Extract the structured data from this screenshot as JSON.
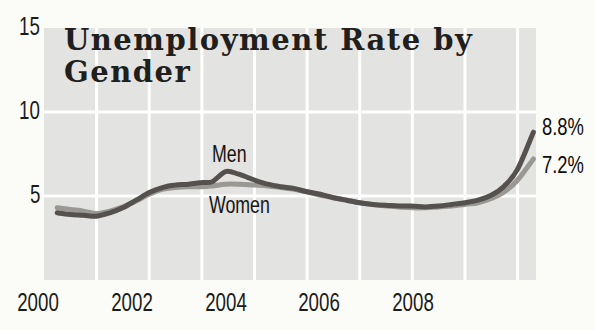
{
  "chart_data": {
    "type": "line",
    "title": "Unemployment Rate by Gender",
    "title_lines": [
      "Unemployment Rate by",
      "Gender"
    ],
    "xlabel": "",
    "ylabel": "",
    "xlim": [
      2000,
      2009.35
    ],
    "ylim": [
      0,
      15
    ],
    "x_tick_labels": [
      "2000",
      "2002",
      "2004",
      "2006",
      "2008"
    ],
    "x_tick_years": [
      2000,
      2002,
      2004,
      2006,
      2008
    ],
    "y_tick_labels": [
      "15",
      "10",
      "5"
    ],
    "y_tick_values": [
      15,
      10,
      5
    ],
    "grid": {
      "enabled": true,
      "vertical_years": [
        2001,
        2002,
        2003,
        2004,
        2005,
        2006,
        2007,
        2008,
        2009
      ],
      "horizontal_values": [
        5,
        10
      ]
    },
    "legend_position": "inline-labels",
    "colors": {
      "plot_bg": "#e3e3e1",
      "grid": "#ffffff",
      "page_bg": "#fbfbf8",
      "title_text": "#211f1d",
      "axis_text": "#1c1b19",
      "end_label_text": "#0c0b0a"
    },
    "series": [
      {
        "name": "Women",
        "color": "#9a9894",
        "end_label": "7.2%",
        "end_value": 7.2,
        "points": [
          [
            2000.25,
            4.3
          ],
          [
            2000.5,
            4.2
          ],
          [
            2000.75,
            4.1
          ],
          [
            2001,
            3.95
          ],
          [
            2001.25,
            4.1
          ],
          [
            2001.5,
            4.35
          ],
          [
            2001.75,
            4.7
          ],
          [
            2002,
            5.1
          ],
          [
            2002.25,
            5.4
          ],
          [
            2002.5,
            5.5
          ],
          [
            2002.75,
            5.55
          ],
          [
            2003,
            5.55
          ],
          [
            2003.2,
            5.6
          ],
          [
            2003.45,
            5.7
          ],
          [
            2003.7,
            5.7
          ],
          [
            2004,
            5.65
          ],
          [
            2004.25,
            5.6
          ],
          [
            2004.5,
            5.5
          ],
          [
            2004.75,
            5.4
          ],
          [
            2005,
            5.25
          ],
          [
            2005.25,
            5.05
          ],
          [
            2005.5,
            4.9
          ],
          [
            2005.75,
            4.75
          ],
          [
            2006,
            4.6
          ],
          [
            2006.25,
            4.5
          ],
          [
            2006.5,
            4.4
          ],
          [
            2006.75,
            4.35
          ],
          [
            2007,
            4.3
          ],
          [
            2007.25,
            4.3
          ],
          [
            2007.5,
            4.35
          ],
          [
            2007.75,
            4.4
          ],
          [
            2008,
            4.5
          ],
          [
            2008.25,
            4.6
          ],
          [
            2008.5,
            4.85
          ],
          [
            2008.75,
            5.25
          ],
          [
            2009,
            5.95
          ],
          [
            2009.3,
            7.2
          ]
        ]
      },
      {
        "name": "Men",
        "color": "#54514e",
        "end_label": "8.8%",
        "end_value": 8.8,
        "points": [
          [
            2000.25,
            4.0
          ],
          [
            2000.5,
            3.9
          ],
          [
            2000.75,
            3.85
          ],
          [
            2001,
            3.8
          ],
          [
            2001.25,
            4.0
          ],
          [
            2001.5,
            4.3
          ],
          [
            2001.75,
            4.75
          ],
          [
            2002,
            5.2
          ],
          [
            2002.25,
            5.5
          ],
          [
            2002.5,
            5.65
          ],
          [
            2002.75,
            5.7
          ],
          [
            2003,
            5.8
          ],
          [
            2003.2,
            5.85
          ],
          [
            2003.45,
            6.45
          ],
          [
            2003.7,
            6.3
          ],
          [
            2004,
            5.95
          ],
          [
            2004.25,
            5.7
          ],
          [
            2004.5,
            5.55
          ],
          [
            2004.75,
            5.45
          ],
          [
            2005,
            5.25
          ],
          [
            2005.25,
            5.1
          ],
          [
            2005.5,
            4.9
          ],
          [
            2005.75,
            4.75
          ],
          [
            2006,
            4.6
          ],
          [
            2006.25,
            4.5
          ],
          [
            2006.5,
            4.45
          ],
          [
            2006.75,
            4.4
          ],
          [
            2007,
            4.4
          ],
          [
            2007.25,
            4.35
          ],
          [
            2007.5,
            4.4
          ],
          [
            2007.75,
            4.5
          ],
          [
            2008,
            4.6
          ],
          [
            2008.25,
            4.75
          ],
          [
            2008.5,
            5.05
          ],
          [
            2008.75,
            5.6
          ],
          [
            2009,
            6.6
          ],
          [
            2009.3,
            8.8
          ]
        ]
      }
    ]
  }
}
